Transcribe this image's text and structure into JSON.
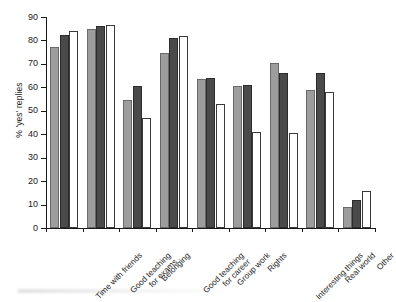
{
  "chart_data": {
    "type": "bar",
    "title": "",
    "xlabel": "",
    "ylabel": "% 'yes' replies",
    "ylim": [
      0,
      90
    ],
    "yticks": [
      0,
      10,
      20,
      30,
      40,
      50,
      60,
      70,
      80,
      90
    ],
    "grid": false,
    "legend": "none",
    "orientation": "vertical",
    "bar_group_style": "clustered",
    "categories": [
      "Time with friends",
      "Good teaching\nfor exams",
      "Belonging",
      "Good teaching\nfor career",
      "Group work",
      "Rights",
      "Interesting things",
      "Real world",
      "Other"
    ],
    "series": [
      {
        "name": "series-1",
        "color": "#9d9d9d",
        "fill": "light-grey",
        "values": [
          77,
          85,
          54.5,
          74.5,
          63.5,
          60.5,
          70.5,
          59,
          9
        ]
      },
      {
        "name": "series-2",
        "color": "#4a4a4a",
        "fill": "dark-grey",
        "values": [
          82.5,
          86,
          60.5,
          81,
          64,
          61,
          66,
          66,
          12
        ]
      },
      {
        "name": "series-3",
        "color": "#ffffff",
        "fill": "white-outline",
        "values": [
          84,
          86.5,
          47,
          82,
          53,
          41,
          40.5,
          58,
          16
        ]
      }
    ]
  }
}
